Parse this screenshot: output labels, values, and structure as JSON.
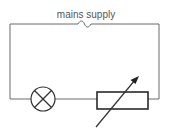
{
  "diagram": {
    "type": "circuit",
    "supply_label": "mains supply",
    "components": [
      {
        "id": "ac-supply",
        "symbol": "ac-source-icon",
        "label": "mains supply"
      },
      {
        "id": "lamp",
        "symbol": "lamp-icon"
      },
      {
        "id": "variable-resistor",
        "symbol": "variable-resistor-icon"
      }
    ],
    "colors": {
      "wire": "#6b6b6b",
      "component": "#333333",
      "text": "#555555"
    }
  }
}
